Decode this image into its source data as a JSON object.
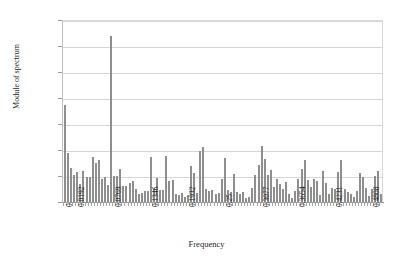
{
  "chart_data": {
    "type": "bar",
    "title": "",
    "xlabel": "Frequency",
    "ylabel": "Module of spectrum",
    "ylim": [
      0,
      70000
    ],
    "xlim": [
      0,
      0.5
    ],
    "grid": true,
    "legend": null,
    "ytick_labels": [
      "0",
      "10000",
      "20000",
      "30000",
      "40000",
      "50000",
      "60000",
      "70000"
    ],
    "ytick_values": [
      0,
      10000,
      20000,
      30000,
      40000,
      50000,
      60000,
      70000
    ],
    "xtick_labels": [
      "0",
      "0.0192",
      "0.0769",
      "0.1346",
      "0.1932",
      "0.25",
      "0.3077",
      "0.3654",
      "0.4231",
      "0.4808"
    ],
    "xtick_values": [
      0,
      0.0192,
      0.0769,
      0.1346,
      0.1932,
      0.25,
      0.3077,
      0.3654,
      0.4231,
      0.4808
    ],
    "bar_color": "#8e8e8e",
    "x": [
      0.0,
      0.0048,
      0.0096,
      0.0144,
      0.0192,
      0.024,
      0.0288,
      0.0337,
      0.0385,
      0.0433,
      0.0481,
      0.0529,
      0.0577,
      0.0625,
      0.0673,
      0.0721,
      0.0769,
      0.0817,
      0.0865,
      0.0913,
      0.0962,
      0.101,
      0.1058,
      0.1106,
      0.1154,
      0.1202,
      0.125,
      0.1298,
      0.1346,
      0.1394,
      0.1442,
      0.149,
      0.1538,
      0.1587,
      0.1635,
      0.1683,
      0.1731,
      0.1779,
      0.1827,
      0.1875,
      0.1923,
      0.1971,
      0.2019,
      0.2067,
      0.2115,
      0.2163,
      0.2212,
      0.226,
      0.2308,
      0.2356,
      0.2404,
      0.2452,
      0.25,
      0.2548,
      0.2596,
      0.2644,
      0.2692,
      0.274,
      0.2788,
      0.2837,
      0.2885,
      0.2933,
      0.2981,
      0.3029,
      0.3077,
      0.3125,
      0.3173,
      0.3221,
      0.3269,
      0.3317,
      0.3365,
      0.3413,
      0.3462,
      0.351,
      0.3558,
      0.3606,
      0.3654,
      0.3702,
      0.375,
      0.3798,
      0.3846,
      0.3894,
      0.3942,
      0.399,
      0.4038,
      0.4087,
      0.4135,
      0.4183,
      0.4231,
      0.4279,
      0.4327,
      0.4375,
      0.4423,
      0.4471,
      0.4519,
      0.4567,
      0.4615,
      0.4663,
      0.4712,
      0.476,
      0.4808,
      0.4856,
      0.4904,
      0.4952
    ],
    "values": [
      37500,
      19000,
      13000,
      10500,
      11500,
      6800,
      11800,
      9700,
      9500,
      17500,
      15000,
      16000,
      8800,
      9600,
      6600,
      64000,
      10000,
      10000,
      12800,
      6000,
      6300,
      7200,
      8000,
      5000,
      3000,
      3600,
      4300,
      4100,
      17200,
      5400,
      9200,
      4500,
      4800,
      17700,
      8200,
      8400,
      3000,
      2600,
      3600,
      2100,
      2600,
      14000,
      11000,
      3500,
      19500,
      21000,
      5000,
      4200,
      4800,
      3200,
      3400,
      8900,
      17000,
      4600,
      4000,
      10800,
      3800,
      3200,
      3800,
      1400,
      2000,
      5500,
      10200,
      14200,
      21600,
      16400,
      10500,
      12300,
      5800,
      9000,
      7000,
      5000,
      7800,
      3000,
      1700,
      4200,
      9000,
      12600,
      16000,
      8500,
      5800,
      9000,
      8000,
      2600,
      11800,
      7200,
      3000,
      5500,
      5000,
      11500,
      16000,
      5000,
      4000,
      3000,
      2000,
      4400,
      11000,
      9700,
      5300,
      2500,
      5000,
      10000,
      12000,
      3000
    ]
  }
}
